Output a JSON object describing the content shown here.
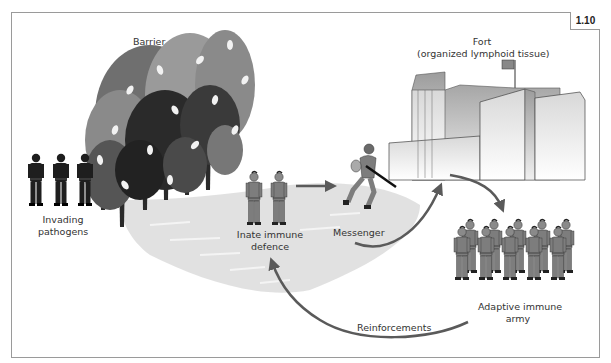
{
  "figure": {
    "number": "1.10",
    "type": "illustration"
  },
  "labels": {
    "barrier": "Barrier",
    "fort_line1": "Fort",
    "fort_line2": "(organized lymphoid tissue)",
    "invading_line1": "Invading",
    "invading_line2": "pathogens",
    "innate_line1": "Inate immune",
    "innate_line2": "defence",
    "messenger": "Messenger",
    "adaptive_line1": "Adaptive immune",
    "adaptive_line2": "army",
    "reinforcements": "Reinforcements"
  },
  "elements": [
    {
      "id": "invading-pathogens",
      "count": 3,
      "color": "#1e1e1e"
    },
    {
      "id": "barrier-trees",
      "count": 8
    },
    {
      "id": "innate-soldiers",
      "count": 2,
      "color": "#7a7a7a"
    },
    {
      "id": "messenger-soldier",
      "count": 1
    },
    {
      "id": "fort",
      "has_flag": true
    },
    {
      "id": "adaptive-army",
      "rows": 2,
      "columns": 5
    }
  ],
  "arrows": [
    {
      "from": "Inate immune defence",
      "to": "Messenger"
    },
    {
      "from": "Messenger",
      "to": "Fort"
    },
    {
      "from": "Fort",
      "to": "Adaptive immune army"
    },
    {
      "from": "Adaptive immune army",
      "to": "Inate immune defence",
      "label": "Reinforcements"
    }
  ],
  "colors": {
    "arrow": "#5a5a5a",
    "frame": "#9a9a9a",
    "shadow": "#dcdcdc",
    "pathogen": "#1e1e1e",
    "soldier": "#7d7d7d",
    "fort_light": "#e4e4e4",
    "fort_dark": "#a8a8a8"
  }
}
